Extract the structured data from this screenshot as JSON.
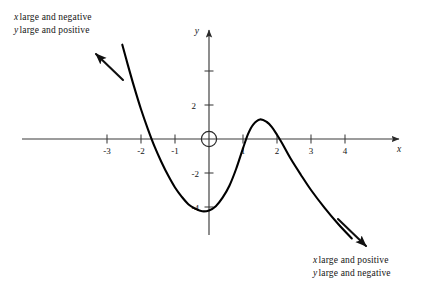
{
  "figure": {
    "kind": "cartesian-graph",
    "background_color": "#ffffff",
    "ink_color": "#141414",
    "curve_color": "#000000",
    "axis_color": "#3a3a3a"
  },
  "axes": {
    "x_axis_label": "x",
    "y_axis_label": "y",
    "x_tick_labels": [
      "-3",
      "-2",
      "-1",
      "1",
      "2",
      "3",
      "4"
    ],
    "y_tick_labels": [
      "2",
      "-2",
      "-4"
    ],
    "origin_marker": "open-circle"
  },
  "annotations": {
    "upper_left": {
      "line1_var": "x",
      "line1_text": "large and negative",
      "line2_var": "y",
      "line2_text": "large and positive"
    },
    "lower_right": {
      "line1_var": "x",
      "line1_text": "large and positive",
      "line2_var": "y",
      "line2_text": "large and negative"
    }
  },
  "chart_data": {
    "type": "line",
    "title": "",
    "xlabel": "x",
    "ylabel": "y",
    "grid": false,
    "legend": false,
    "xlim": [
      -3.8,
      5.0
    ],
    "ylim": [
      -6.0,
      5.5
    ],
    "x_ticks": [
      -3,
      -2,
      -1,
      1,
      2,
      3,
      4
    ],
    "y_ticks": [
      2,
      -2,
      -4
    ],
    "y_ticks_unlabeled": [
      4
    ],
    "x_roots": [
      -2,
      1,
      2.15
    ],
    "local_minimum": {
      "x": -0.15,
      "y": -4.25
    },
    "local_maximum": {
      "x": 1.5,
      "y": 1.15
    },
    "end_behavior": {
      "left": "y large and positive as x large and negative",
      "right": "y large and negative as x large and positive"
    },
    "series": [
      {
        "name": "curve",
        "points": [
          [
            -2.55,
            5.55
          ],
          [
            -2.4,
            4.45
          ],
          [
            -2.2,
            3.05
          ],
          [
            -2.0,
            1.75
          ],
          [
            -1.8,
            0.6
          ],
          [
            -1.6,
            -0.45
          ],
          [
            -1.4,
            -1.35
          ],
          [
            -1.2,
            -2.15
          ],
          [
            -1.0,
            -2.85
          ],
          [
            -0.8,
            -3.4
          ],
          [
            -0.6,
            -3.85
          ],
          [
            -0.4,
            -4.1
          ],
          [
            -0.2,
            -4.25
          ],
          [
            0.0,
            -4.2
          ],
          [
            0.2,
            -3.95
          ],
          [
            0.4,
            -3.45
          ],
          [
            0.6,
            -2.75
          ],
          [
            0.8,
            -1.75
          ],
          [
            1.0,
            -0.55
          ],
          [
            1.15,
            0.3
          ],
          [
            1.3,
            0.85
          ],
          [
            1.5,
            1.15
          ],
          [
            1.7,
            1.0
          ],
          [
            1.85,
            0.7
          ],
          [
            2.0,
            0.25
          ],
          [
            2.15,
            -0.25
          ],
          [
            2.4,
            -1.15
          ],
          [
            2.7,
            -2.1
          ],
          [
            3.0,
            -3.0
          ],
          [
            3.4,
            -4.05
          ],
          [
            3.8,
            -5.0
          ],
          [
            4.2,
            -5.85
          ]
        ]
      }
    ],
    "arrows": [
      {
        "name": "left-tail-arrow",
        "direction": "up-left"
      },
      {
        "name": "right-tail-arrow",
        "direction": "down-right"
      },
      {
        "name": "x-axis-arrow",
        "direction": "right"
      },
      {
        "name": "y-axis-arrow",
        "direction": "up"
      }
    ]
  }
}
